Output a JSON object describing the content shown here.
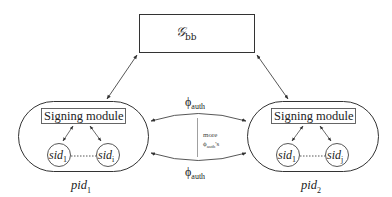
{
  "diagram": {
    "top_box": {
      "symbol": "𝒢",
      "subscript": "bb"
    },
    "parties": [
      {
        "label": "pid",
        "label_sub": "1",
        "module_label": "Signing module",
        "sessions": [
          {
            "label": "sid",
            "sub": "1"
          },
          {
            "label": "sid",
            "sub": "i"
          }
        ]
      },
      {
        "label": "pid",
        "label_sub": "2",
        "module_label": "Signing module",
        "sessions": [
          {
            "label": "sid",
            "sub": "1"
          },
          {
            "label": "sid",
            "sub": "j"
          }
        ]
      }
    ],
    "channels": {
      "top": {
        "symbol": "ϕ",
        "sub": "auth"
      },
      "bottom": {
        "symbol": "ϕ",
        "sub": "auth"
      },
      "middle_note": {
        "line1": "more",
        "symbol": "ϕ",
        "sub": "auth",
        "suffix": "'s"
      }
    }
  }
}
